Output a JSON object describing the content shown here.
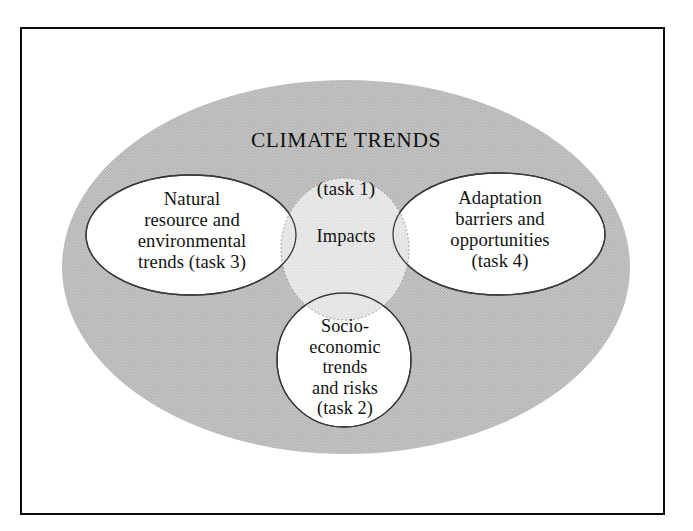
{
  "figure": {
    "type": "venn-diagram",
    "caption_title": "CLIMATE TRENDS",
    "caption_subtitle": "(task 1)"
  },
  "colors": {
    "outer_ellipse_fill": "#bcbcbc",
    "inner_circle_fill": "#ffffff",
    "overlap_fill": "#e3e3e3",
    "outline": "#2b2b2b",
    "frame": "#0d0d0d",
    "text": "#121212",
    "background": "#ffffff"
  },
  "container": {
    "label": "CLIMATE TRENDS",
    "task": "(task 1)"
  },
  "sets": [
    {
      "id": "natural-resource",
      "position": "left",
      "label": "Natural\nresource and\nenvironmental\ntrends (task 3)",
      "task": "task 3"
    },
    {
      "id": "adaptation-barriers",
      "position": "right",
      "label": "Adaptation\nbarriers and\nopportunities\n(task 4)",
      "task": "task 4"
    },
    {
      "id": "socio-economic",
      "position": "bottom",
      "label": "Socio-\neconomic\ntrends\nand risks\n(task 2)",
      "task": "task 2"
    }
  ],
  "intersection": {
    "id": "impacts",
    "label": "Impacts"
  }
}
